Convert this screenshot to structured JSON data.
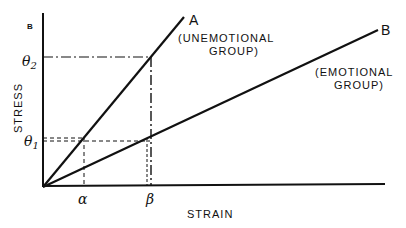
{
  "figure": {
    "panel_label": "B",
    "y_axis_label": "STRESS",
    "x_axis_label": "STRAIN",
    "y_ticks": {
      "theta2": "θ",
      "theta2_sub": "2",
      "theta1": "θ",
      "theta1_sub": "1"
    },
    "x_ticks": {
      "alpha": "α",
      "beta": "β"
    },
    "lines": [
      {
        "id": "A",
        "label": "A",
        "group_line1": "(UNEMOTIONAL",
        "group_line2": "GROUP)",
        "slope": "steep"
      },
      {
        "id": "B",
        "label": "B",
        "group_line1": "(EMOTIONAL",
        "group_line2": "GROUP)",
        "slope": "shallow"
      }
    ],
    "colors": {
      "ink": "#111111",
      "background": "#ffffff"
    }
  }
}
